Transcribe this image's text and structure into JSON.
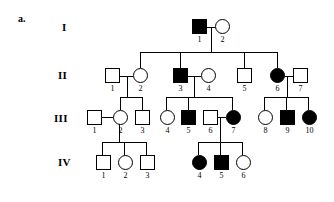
{
  "figure": {
    "panel_label": "a.",
    "type": "pedigree-chart",
    "generations": [
      "I",
      "II",
      "III",
      "IV"
    ],
    "legend": {
      "filled": "affected",
      "open": "unaffected",
      "square": "male",
      "circle": "female"
    },
    "colors": {
      "line": "#000000",
      "affected_fill": "#000000",
      "unaffected_fill": "#ffffff",
      "background": "#ffffff"
    }
  },
  "individuals": [
    {
      "id": "I-1",
      "generation": "I",
      "number": "1",
      "sex": "male",
      "affected": true,
      "x": 192,
      "y": 19
    },
    {
      "id": "I-2",
      "generation": "I",
      "number": "2",
      "sex": "female",
      "affected": false,
      "x": 215,
      "y": 19
    },
    {
      "id": "II-1",
      "generation": "II",
      "number": "1",
      "sex": "male",
      "affected": false,
      "x": 105,
      "y": 68
    },
    {
      "id": "II-2",
      "generation": "II",
      "number": "2",
      "sex": "female",
      "affected": false,
      "x": 133,
      "y": 68
    },
    {
      "id": "II-3",
      "generation": "II",
      "number": "3",
      "sex": "male",
      "affected": true,
      "x": 173,
      "y": 68
    },
    {
      "id": "II-4",
      "generation": "II",
      "number": "4",
      "sex": "female",
      "affected": false,
      "x": 201,
      "y": 68
    },
    {
      "id": "II-5",
      "generation": "II",
      "number": "5",
      "sex": "male",
      "affected": false,
      "x": 237,
      "y": 68
    },
    {
      "id": "II-6",
      "generation": "II",
      "number": "6",
      "sex": "female",
      "affected": true,
      "x": 270,
      "y": 68
    },
    {
      "id": "II-7",
      "generation": "II",
      "number": "7",
      "sex": "male",
      "affected": false,
      "x": 293,
      "y": 68
    },
    {
      "id": "III-1",
      "generation": "III",
      "number": "1",
      "sex": "male",
      "affected": false,
      "x": 87,
      "y": 110
    },
    {
      "id": "III-2",
      "generation": "III",
      "number": "2",
      "sex": "female",
      "affected": false,
      "x": 113,
      "y": 110
    },
    {
      "id": "III-3",
      "generation": "III",
      "number": "3",
      "sex": "male",
      "affected": false,
      "x": 135,
      "y": 110
    },
    {
      "id": "III-4",
      "generation": "III",
      "number": "4",
      "sex": "female",
      "affected": false,
      "x": 160,
      "y": 110
    },
    {
      "id": "III-5",
      "generation": "III",
      "number": "5",
      "sex": "male",
      "affected": true,
      "x": 181,
      "y": 110
    },
    {
      "id": "III-6",
      "generation": "III",
      "number": "6",
      "sex": "male",
      "affected": false,
      "x": 203,
      "y": 110
    },
    {
      "id": "III-7",
      "generation": "III",
      "number": "7",
      "sex": "female",
      "affected": true,
      "x": 226,
      "y": 110
    },
    {
      "id": "III-8",
      "generation": "III",
      "number": "8",
      "sex": "female",
      "affected": false,
      "x": 258,
      "y": 110
    },
    {
      "id": "III-9",
      "generation": "III",
      "number": "9",
      "sex": "male",
      "affected": true,
      "x": 280,
      "y": 110
    },
    {
      "id": "III-10",
      "generation": "III",
      "number": "10",
      "sex": "female",
      "affected": true,
      "x": 302,
      "y": 110
    },
    {
      "id": "IV-1",
      "generation": "IV",
      "number": "1",
      "sex": "male",
      "affected": false,
      "x": 96,
      "y": 155
    },
    {
      "id": "IV-2",
      "generation": "IV",
      "number": "2",
      "sex": "female",
      "affected": false,
      "x": 118,
      "y": 155
    },
    {
      "id": "IV-3",
      "generation": "IV",
      "number": "3",
      "sex": "male",
      "affected": false,
      "x": 140,
      "y": 155
    },
    {
      "id": "IV-4",
      "generation": "IV",
      "number": "4",
      "sex": "female",
      "affected": true,
      "x": 192,
      "y": 155
    },
    {
      "id": "IV-5",
      "generation": "IV",
      "number": "5",
      "sex": "male",
      "affected": true,
      "x": 214,
      "y": 155
    },
    {
      "id": "IV-6",
      "generation": "IV",
      "number": "6",
      "sex": "female",
      "affected": false,
      "x": 236,
      "y": 155
    }
  ],
  "generation_labels": [
    {
      "text": "I",
      "x": 62,
      "y": 22
    },
    {
      "text": "II",
      "x": 58,
      "y": 70
    },
    {
      "text": "III",
      "x": 54,
      "y": 113
    },
    {
      "text": "IV",
      "x": 58,
      "y": 157
    }
  ],
  "matings": [
    {
      "id": "I-1xI-2",
      "partners": [
        "I-1",
        "I-2"
      ],
      "children": [
        "II-2",
        "II-3",
        "II-5",
        "II-6"
      ]
    },
    {
      "id": "II-1xII-2",
      "partners": [
        "II-1",
        "II-2"
      ],
      "children": [
        "III-2",
        "III-3"
      ]
    },
    {
      "id": "II-3xII-4",
      "partners": [
        "II-3",
        "II-4"
      ],
      "children": [
        "III-4",
        "III-5",
        "III-7"
      ]
    },
    {
      "id": "II-6xII-7",
      "partners": [
        "II-6",
        "II-7"
      ],
      "children": [
        "III-8",
        "III-9",
        "III-10"
      ]
    },
    {
      "id": "III-1xIII-2",
      "partners": [
        "III-1",
        "III-2"
      ],
      "children": [
        "IV-1",
        "IV-2",
        "IV-3"
      ]
    },
    {
      "id": "III-6xIII-7",
      "partners": [
        "III-6",
        "III-7"
      ],
      "children": [
        "IV-4",
        "IV-5",
        "IV-6"
      ]
    }
  ],
  "lines": [
    {
      "name": "mate-line-I-1-I-2",
      "o": "h",
      "x": 207,
      "y": 26.5,
      "len": 8
    },
    {
      "name": "descent-I",
      "o": "v",
      "x": 211,
      "y": 26.5,
      "len": 26
    },
    {
      "name": "sibship-bar-II",
      "o": "h",
      "x": 140,
      "y": 52,
      "len": 138
    },
    {
      "name": "drop-II-2",
      "o": "v",
      "x": 140,
      "y": 52,
      "len": 16
    },
    {
      "name": "drop-II-3",
      "o": "v",
      "x": 180,
      "y": 52,
      "len": 16
    },
    {
      "name": "drop-II-5",
      "o": "v",
      "x": 244,
      "y": 52,
      "len": 16
    },
    {
      "name": "drop-II-6",
      "o": "v",
      "x": 277,
      "y": 52,
      "len": 16
    },
    {
      "name": "mate-line-II-1-II-2",
      "o": "h",
      "x": 120,
      "y": 75.5,
      "len": 13
    },
    {
      "name": "descent-II-1-II-2",
      "o": "v",
      "x": 127,
      "y": 75.5,
      "len": 22
    },
    {
      "name": "sibship-bar-III-a",
      "o": "h",
      "x": 120,
      "y": 97,
      "len": 22
    },
    {
      "name": "drop-III-2",
      "o": "v",
      "x": 120,
      "y": 97,
      "len": 13
    },
    {
      "name": "drop-III-3",
      "o": "v",
      "x": 141.5,
      "y": 97,
      "len": 13
    },
    {
      "name": "mate-line-II-3-II-4",
      "o": "h",
      "x": 188,
      "y": 75.5,
      "len": 13
    },
    {
      "name": "descent-II-3-II-4",
      "o": "v",
      "x": 194,
      "y": 75.5,
      "len": 22
    },
    {
      "name": "sibship-bar-III-b",
      "o": "h",
      "x": 166,
      "y": 97,
      "len": 67
    },
    {
      "name": "drop-III-4",
      "o": "v",
      "x": 166,
      "y": 97,
      "len": 13
    },
    {
      "name": "drop-III-5",
      "o": "v",
      "x": 187.5,
      "y": 97,
      "len": 13
    },
    {
      "name": "drop-III-7",
      "o": "v",
      "x": 232,
      "y": 97,
      "len": 13
    },
    {
      "name": "mate-line-II-6-II-7",
      "o": "h",
      "x": 285,
      "y": 75.5,
      "len": 8
    },
    {
      "name": "descent-II-6-II-7",
      "o": "v",
      "x": 286.5,
      "y": 75.5,
      "len": 22
    },
    {
      "name": "sibship-bar-III-c",
      "o": "h",
      "x": 264,
      "y": 97,
      "len": 44
    },
    {
      "name": "drop-III-8",
      "o": "v",
      "x": 264,
      "y": 97,
      "len": 13
    },
    {
      "name": "drop-III-9",
      "o": "v",
      "x": 286,
      "y": 97,
      "len": 13
    },
    {
      "name": "drop-III-10",
      "o": "v",
      "x": 308,
      "y": 97,
      "len": 13
    },
    {
      "name": "mate-line-III-1-III-2",
      "o": "h",
      "x": 100,
      "y": 116.5,
      "len": 13
    },
    {
      "name": "descent-III-1-III-2",
      "o": "v",
      "x": 119,
      "y": 116.5,
      "len": 26
    },
    {
      "name": "sibship-bar-IV-a",
      "o": "h",
      "x": 102,
      "y": 142,
      "len": 44
    },
    {
      "name": "drop-IV-1",
      "o": "v",
      "x": 102,
      "y": 142,
      "len": 13
    },
    {
      "name": "drop-IV-2",
      "o": "v",
      "x": 124,
      "y": 142,
      "len": 13
    },
    {
      "name": "drop-IV-3",
      "o": "v",
      "x": 146,
      "y": 142,
      "len": 13
    },
    {
      "name": "mate-line-III-6-III-7",
      "o": "h",
      "x": 216,
      "y": 116.5,
      "len": 10
    },
    {
      "name": "descent-III-6-III-7",
      "o": "v",
      "x": 220,
      "y": 116.5,
      "len": 26
    },
    {
      "name": "sibship-bar-IV-b",
      "o": "h",
      "x": 198,
      "y": 142,
      "len": 44
    },
    {
      "name": "drop-IV-4",
      "o": "v",
      "x": 198,
      "y": 142,
      "len": 13
    },
    {
      "name": "drop-IV-5",
      "o": "v",
      "x": 220,
      "y": 142,
      "len": 13
    },
    {
      "name": "drop-IV-6",
      "o": "v",
      "x": 242,
      "y": 142,
      "len": 13
    }
  ]
}
